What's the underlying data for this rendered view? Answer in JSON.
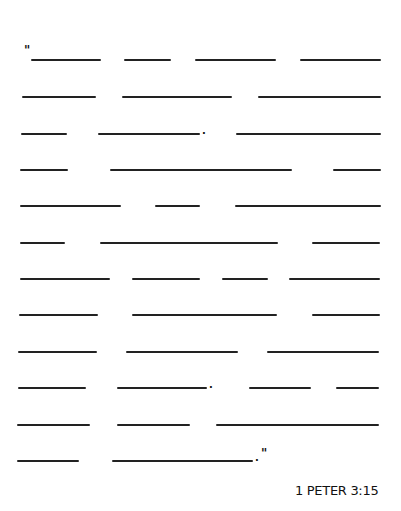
{
  "worksheet": {
    "opening_quote": "\"",
    "closing_quote": "\"",
    "period": ".",
    "reference": "1 PETER 3:15",
    "rows": [
      {
        "y": 60,
        "blanks": [
          [
            31,
            101
          ],
          [
            124,
            171
          ],
          [
            195,
            276
          ],
          [
            300,
            381
          ]
        ]
      },
      {
        "y": 97,
        "blanks": [
          [
            22,
            96
          ],
          [
            122,
            232
          ],
          [
            258,
            381
          ]
        ]
      },
      {
        "y": 134,
        "blanks": [
          [
            21,
            67
          ],
          [
            98,
            200
          ],
          [
            236,
            381
          ]
        ],
        "period_x": 202
      },
      {
        "y": 170,
        "blanks": [
          [
            20,
            68
          ],
          [
            110,
            292
          ],
          [
            333,
            381
          ]
        ]
      },
      {
        "y": 206,
        "blanks": [
          [
            20,
            121
          ],
          [
            155,
            200
          ],
          [
            235,
            381
          ]
        ]
      },
      {
        "y": 243,
        "blanks": [
          [
            20,
            65
          ],
          [
            100,
            278
          ],
          [
            312,
            380
          ]
        ]
      },
      {
        "y": 279,
        "blanks": [
          [
            20,
            110
          ],
          [
            132,
            200
          ],
          [
            222,
            268
          ],
          [
            289,
            380
          ]
        ]
      },
      {
        "y": 315,
        "blanks": [
          [
            19,
            98
          ],
          [
            132,
            277
          ],
          [
            312,
            380
          ]
        ]
      },
      {
        "y": 352,
        "blanks": [
          [
            18,
            97
          ],
          [
            126,
            238
          ],
          [
            267,
            379
          ]
        ]
      },
      {
        "y": 388,
        "blanks": [
          [
            18,
            86
          ],
          [
            117,
            207
          ],
          [
            249,
            311
          ],
          [
            336,
            379
          ]
        ],
        "period_x": 209
      },
      {
        "y": 425,
        "blanks": [
          [
            17,
            90
          ],
          [
            117,
            190
          ],
          [
            216,
            379
          ]
        ]
      },
      {
        "y": 461,
        "blanks": [
          [
            17,
            79
          ],
          [
            112,
            253
          ]
        ],
        "period_x": 255
      }
    ]
  }
}
